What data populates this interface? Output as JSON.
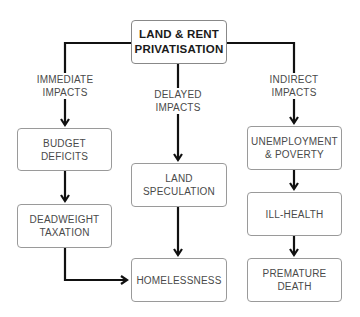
{
  "diagram": {
    "root": {
      "line1": "LAND & RENT",
      "line2": "PRIVATISATION"
    },
    "branches": {
      "immediate": {
        "line1": "IMMEDIATE",
        "line2": "IMPACTS"
      },
      "delayed": {
        "line1": "DELAYED",
        "line2": "IMPACTS"
      },
      "indirect": {
        "line1": "INDIRECT",
        "line2": "IMPACTS"
      }
    },
    "nodes": {
      "budget_deficits": {
        "line1": "BUDGET",
        "line2": "DEFICITS"
      },
      "deadweight_taxation": {
        "line1": "DEADWEIGHT",
        "line2": "TAXATION"
      },
      "land_speculation": {
        "line1": "LAND",
        "line2": "SPECULATION"
      },
      "homelessness": {
        "line1": "HOMELESSNESS"
      },
      "unemployment_poverty": {
        "line1": "UNEMPLOYMENT",
        "line2": "& POVERTY"
      },
      "ill_health": {
        "line1": "ILL-HEALTH"
      },
      "premature_death": {
        "line1": "PREMATURE",
        "line2": "DEATH"
      }
    },
    "edges": [
      [
        "root",
        "budget_deficits",
        "IMMEDIATE IMPACTS"
      ],
      [
        "root",
        "land_speculation",
        "DELAYED IMPACTS"
      ],
      [
        "root",
        "unemployment_poverty",
        "INDIRECT IMPACTS"
      ],
      [
        "budget_deficits",
        "deadweight_taxation"
      ],
      [
        "deadweight_taxation",
        "homelessness"
      ],
      [
        "land_speculation",
        "homelessness"
      ],
      [
        "unemployment_poverty",
        "ill_health"
      ],
      [
        "ill_health",
        "premature_death"
      ]
    ],
    "colors": {
      "line": "#111111",
      "box_border": "#9a9a9a",
      "text": "#4a4a4a",
      "root_text": "#1a1a1a"
    }
  }
}
